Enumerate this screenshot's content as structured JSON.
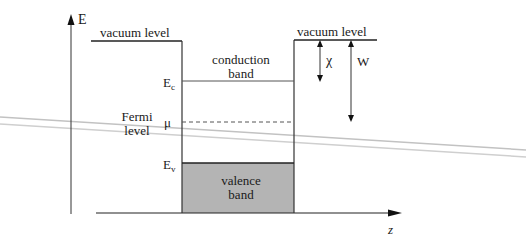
{
  "diagram": {
    "axes": {
      "vertical_label": "E",
      "horizontal_label": "z"
    },
    "levels": {
      "vacuum_left_label": "vacuum level",
      "vacuum_right_label": "vacuum level",
      "conduction_band_label_line1": "conduction",
      "conduction_band_label_line2": "band",
      "ec_main": "E",
      "ec_sub": "c",
      "fermi_label_line1": "Fermi",
      "fermi_label_line2": "level",
      "mu": "μ",
      "ev_main": "E",
      "ev_sub": "v",
      "valence_band_label_line1": "valence",
      "valence_band_label_line2": "band"
    },
    "quantities": {
      "electron_affinity": "χ",
      "work_function": "W"
    },
    "colors": {
      "line": "#1a1a1a",
      "valence_fill": "#b4b4b4",
      "artifact": "#bdbdbd"
    }
  }
}
